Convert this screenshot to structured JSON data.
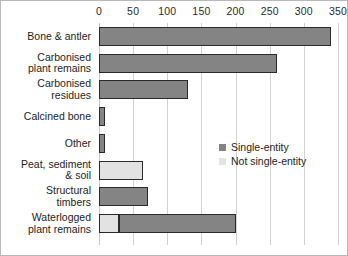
{
  "chart_data": {
    "type": "bar",
    "orientation": "horizontal",
    "stacked": true,
    "title": "",
    "subtitle": "",
    "xlabel": "",
    "ylabel": "",
    "xlim": [
      0,
      350
    ],
    "xticks": [
      0,
      50,
      100,
      150,
      200,
      250,
      300,
      350
    ],
    "xtick_labels": [
      "0",
      "50",
      "100",
      "150",
      "200",
      "250",
      "300",
      "350"
    ],
    "grid": "vertical",
    "axis_position": "top",
    "categories": [
      "Bone & antler",
      "Carbonised\nplant remains",
      "Carbonised\nresidues",
      "Calcined bone",
      "Other",
      "Peat, sediment\n& soil",
      "Structural\ntimbers",
      "Waterlogged\nplant remains"
    ],
    "series": [
      {
        "name": "Not single-entity",
        "color": "#e2e2e2",
        "values": [
          0,
          0,
          0,
          0,
          0,
          65,
          0,
          30
        ]
      },
      {
        "name": "Single-entity",
        "color": "#848484",
        "values": [
          340,
          260,
          130,
          9,
          9,
          0,
          72,
          170
        ]
      }
    ],
    "totals": [
      340,
      260,
      130,
      9,
      9,
      65,
      72,
      200
    ],
    "legend_position": "center-right",
    "legend": [
      {
        "label": "Single-entity",
        "swatch": "single"
      },
      {
        "label": "Not single-entity",
        "swatch": "notsingle"
      }
    ]
  },
  "colors": {
    "single_entity": "#848484",
    "not_single_entity": "#e2e2e2",
    "bar_border": "#2a2a2a",
    "gridline": "#d2d2d2",
    "frame": "#b9b9b9",
    "text": "#1d1d1d"
  }
}
